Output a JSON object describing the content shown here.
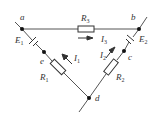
{
  "diagram": {
    "type": "circuit",
    "nodes": {
      "a": {
        "label": "a"
      },
      "b": {
        "label": "b"
      },
      "c": {
        "label": "c"
      },
      "d": {
        "label": "d"
      },
      "e": {
        "label": "e"
      }
    },
    "components": {
      "R3": {
        "main": "R",
        "sub": "3"
      },
      "R1": {
        "main": "R",
        "sub": "1"
      },
      "R2": {
        "main": "R",
        "sub": "2"
      },
      "E1": {
        "main": "E",
        "sub": "1"
      },
      "E2": {
        "main": "E",
        "sub": "2"
      }
    },
    "currents": {
      "I3": {
        "main": "I",
        "sub": "3",
        "direction": "right"
      },
      "I1": {
        "main": "I",
        "sub": "1",
        "direction": "up-left"
      },
      "I2": {
        "main": "I",
        "sub": "2",
        "direction": "up-right"
      }
    },
    "colors": {
      "wire": "#555555",
      "node": "#111111",
      "text": "#333333"
    }
  }
}
